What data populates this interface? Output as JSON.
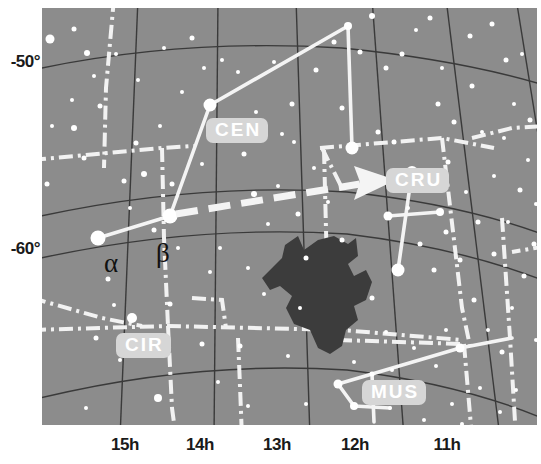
{
  "chart_data": {
    "type": "scatter",
    "title": "",
    "subtitle": "",
    "xlabel": "",
    "ylabel": "",
    "grid": true,
    "legend_position": "none",
    "projection": "conic sky chart (equatorial coordinates)",
    "xlim": [
      15.6,
      10.4
    ],
    "ylim": [
      -66,
      -45
    ],
    "x_ticks": [
      {
        "label": "15h",
        "value": 15,
        "px": 125
      },
      {
        "label": "14h",
        "value": 14,
        "px": 200
      },
      {
        "label": "13h",
        "value": 13,
        "px": 277
      },
      {
        "label": "12h",
        "value": 12,
        "px": 355
      },
      {
        "label": "11h",
        "value": 11,
        "px": 447
      }
    ],
    "y_ticks": [
      {
        "label": "-50°",
        "value": -50,
        "px": 63
      },
      {
        "label": "-60°",
        "value": -60,
        "px": 250
      }
    ],
    "constellation_labels": [
      {
        "name": "CEN",
        "full": "Centaurus",
        "x": 206,
        "y": 118
      },
      {
        "name": "CRU",
        "full": "Crux",
        "x": 386,
        "y": 168
      },
      {
        "name": "CIR",
        "full": "Circinus",
        "x": 116,
        "y": 333
      },
      {
        "name": "MUS",
        "full": "Musca",
        "x": 362,
        "y": 380
      }
    ],
    "star_labels": [
      {
        "label": "α",
        "star": "Alpha Centauri",
        "x": 104,
        "y": 250
      },
      {
        "label": "β",
        "star": "Beta Centauri",
        "x": 156,
        "y": 244
      }
    ],
    "annotations": [
      {
        "type": "arrow",
        "label": "pointers from Centaurus to Crux",
        "from_x": 176,
        "from_y": 214,
        "to_x": 360,
        "to_y": 178
      },
      {
        "type": "dark-nebula",
        "label": "Coalsack Nebula",
        "cx": 315,
        "cy": 290
      }
    ],
    "series": [
      {
        "name": "stars",
        "points": [
          [
            8,
            31,
            9
          ],
          [
            32,
            21,
            5
          ],
          [
            45,
            45,
            6
          ],
          [
            5,
            176,
            5
          ],
          [
            32,
            120,
            6
          ],
          [
            42,
            150,
            5
          ],
          [
            58,
            98,
            5
          ],
          [
            56,
            230,
            15
          ],
          [
            94,
            135,
            5
          ],
          [
            88,
            200,
            4
          ],
          [
            82,
            173,
            5
          ],
          [
            102,
            166,
            6
          ],
          [
            66,
            271,
            5
          ],
          [
            72,
            297,
            4
          ],
          [
            90,
            310,
            10
          ],
          [
            112,
            222,
            5
          ],
          [
            130,
            176,
            5
          ],
          [
            128,
            296,
            5
          ],
          [
            136,
            240,
            4
          ],
          [
            160,
            156,
            4
          ],
          [
            128,
            208,
            15
          ],
          [
            168,
            97,
            13
          ],
          [
            178,
            240,
            4
          ],
          [
            168,
            264,
            4
          ],
          [
            160,
            336,
            5
          ],
          [
            176,
            374,
            4
          ],
          [
            198,
            338,
            5
          ],
          [
            206,
            398,
            4
          ],
          [
            150,
            30,
            5
          ],
          [
            180,
            52,
            4
          ],
          [
            196,
            64,
            4
          ],
          [
            122,
            40,
            4
          ],
          [
            202,
            146,
            5
          ],
          [
            212,
            186,
            6
          ],
          [
            226,
            216,
            4
          ],
          [
            236,
            178,
            4
          ],
          [
            250,
            96,
            5
          ],
          [
            256,
            206,
            5
          ],
          [
            252,
            134,
            4
          ],
          [
            272,
            160,
            4
          ],
          [
            232,
            54,
            4
          ],
          [
            274,
            62,
            5
          ],
          [
            292,
            34,
            5
          ],
          [
            300,
            100,
            5
          ],
          [
            306,
            18,
            8
          ],
          [
            330,
            8,
            6
          ],
          [
            318,
            44,
            5
          ],
          [
            344,
            60,
            5
          ],
          [
            336,
            124,
            5
          ],
          [
            360,
            46,
            5
          ],
          [
            310,
            140,
            13
          ],
          [
            332,
            176,
            6
          ],
          [
            352,
            134,
            5
          ],
          [
            374,
            22,
            4
          ],
          [
            388,
            10,
            5
          ],
          [
            400,
            60,
            4
          ],
          [
            396,
            96,
            5
          ],
          [
            412,
            114,
            5
          ],
          [
            406,
            154,
            5
          ],
          [
            430,
            78,
            5
          ],
          [
            440,
            124,
            4
          ],
          [
            452,
            168,
            4
          ],
          [
            428,
            28,
            5
          ],
          [
            450,
            16,
            5
          ],
          [
            464,
            52,
            5
          ],
          [
            472,
            96,
            4
          ],
          [
            462,
            130,
            4
          ],
          [
            480,
            46,
            4
          ],
          [
            488,
            112,
            5
          ],
          [
            478,
            182,
            5
          ],
          [
            466,
            214,
            4
          ],
          [
            492,
            236,
            5
          ],
          [
            482,
            268,
            5
          ],
          [
            470,
            300,
            4
          ],
          [
            452,
            246,
            5
          ],
          [
            436,
            214,
            5
          ],
          [
            424,
            184,
            4
          ],
          [
            418,
            252,
            5
          ],
          [
            404,
            224,
            5
          ],
          [
            392,
            262,
            5
          ],
          [
            378,
            236,
            5
          ],
          [
            366,
            200,
            4
          ],
          [
            356,
            262,
            13
          ],
          [
            346,
            208,
            9
          ],
          [
            370,
            164,
            12
          ],
          [
            398,
            204,
            8
          ],
          [
            330,
            290,
            5
          ],
          [
            344,
            324,
            4
          ],
          [
            312,
            354,
            4
          ],
          [
            296,
            376,
            9
          ],
          [
            330,
            366,
            5
          ],
          [
            350,
            362,
            4
          ],
          [
            312,
            398,
            8
          ],
          [
            348,
            400,
            4
          ],
          [
            372,
            340,
            4
          ],
          [
            394,
            358,
            4
          ],
          [
            404,
            322,
            4
          ],
          [
            418,
            340,
            9
          ],
          [
            432,
            292,
            5
          ],
          [
            446,
            322,
            4
          ],
          [
            460,
            344,
            5
          ],
          [
            438,
            380,
            4
          ],
          [
            410,
            396,
            4
          ],
          [
            382,
            412,
            4
          ],
          [
            258,
            300,
            4
          ],
          [
            246,
            348,
            4
          ],
          [
            264,
            396,
            4
          ],
          [
            222,
            286,
            4
          ],
          [
            206,
            260,
            4
          ],
          [
            116,
            390,
            8
          ],
          [
            78,
            352,
            4
          ],
          [
            54,
            330,
            5
          ],
          [
            44,
            400,
            4
          ],
          [
            92,
            420,
            5
          ],
          [
            300,
            232,
            5
          ],
          [
            286,
            194,
            4
          ],
          [
            264,
            250,
            5
          ],
          [
            240,
            126,
            4
          ],
          [
            214,
            104,
            4
          ],
          [
            186,
            120,
            4
          ],
          [
            162,
            60,
            4
          ],
          [
            140,
            84,
            4
          ],
          [
            118,
            118,
            4
          ],
          [
            96,
            72,
            4
          ],
          [
            74,
            46,
            4
          ],
          [
            52,
            68,
            4
          ],
          [
            30,
            92,
            4
          ],
          [
            10,
            118,
            4
          ],
          [
            486,
            152,
            4
          ],
          [
            494,
            196,
            4
          ],
          [
            474,
            382,
            4
          ],
          [
            494,
            332,
            4
          ],
          [
            458,
            404,
            4
          ],
          [
            420,
            416,
            4
          ]
        ]
      }
    ]
  }
}
